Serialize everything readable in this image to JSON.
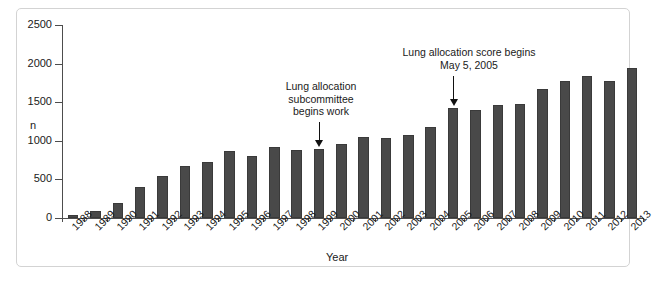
{
  "figure": {
    "y_axis_label": "n",
    "x_axis_label": "Year"
  },
  "annotations": {
    "subcommittee": {
      "text": "Lung allocation\nsubcommittee\nbegins work",
      "points_to_year": "1999"
    },
    "score": {
      "text": "Lung allocation score begins\nMay 5, 2005",
      "points_to_year": "2005"
    }
  },
  "chart_data": {
    "type": "bar",
    "title": "",
    "xlabel": "Year",
    "ylabel": "n",
    "ylim": [
      0,
      2500
    ],
    "yticks": [
      0,
      500,
      1000,
      1500,
      2000,
      2500
    ],
    "ytick_labels": [
      "0",
      "500",
      "1000",
      "1500",
      "2000",
      "2500"
    ],
    "grid": false,
    "legend": null,
    "bar_color": "#494949",
    "categories": [
      "1988",
      "1989",
      "1990",
      "1991",
      "1992",
      "1993",
      "1994",
      "1995",
      "1996",
      "1997",
      "1998",
      "1999",
      "2000",
      "2001",
      "2002",
      "2003",
      "2004",
      "2005",
      "2006",
      "2007",
      "2008",
      "2009",
      "2010",
      "2011",
      "2012",
      "2013"
    ],
    "values": [
      33,
      90,
      200,
      405,
      545,
      670,
      730,
      865,
      800,
      925,
      875,
      900,
      960,
      1055,
      1040,
      1080,
      1185,
      1420,
      1400,
      1465,
      1475,
      1670,
      1775,
      1840,
      1780,
      1945
    ],
    "annotations": [
      {
        "text": "Lung allocation subcommittee begins work",
        "x": "1999"
      },
      {
        "text": "Lung allocation score begins May 5, 2005",
        "x": "2005"
      }
    ]
  }
}
